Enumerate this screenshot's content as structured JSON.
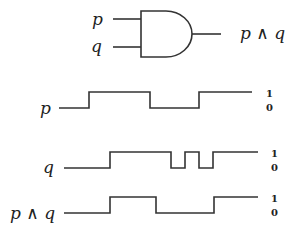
{
  "gate": {
    "type": "AND",
    "input_labels": [
      "p",
      "q"
    ],
    "output_label": "p ∧ q"
  },
  "timing": {
    "levels": {
      "high": "1",
      "low": "0"
    },
    "signals": [
      {
        "name": "p",
        "label": "p",
        "transitions_x": [
          89,
          150,
          199
        ],
        "start_level": 0
      },
      {
        "name": "q",
        "label": "q",
        "transitions_x": [
          110,
          171,
          185,
          199,
          213
        ],
        "start_level": 0
      },
      {
        "name": "p_and_q",
        "label": "p ∧ q",
        "transitions_x": [
          110,
          156,
          214
        ],
        "start_level": 0
      }
    ]
  },
  "colors": {
    "stroke": "#333333",
    "background": "#ffffff"
  }
}
